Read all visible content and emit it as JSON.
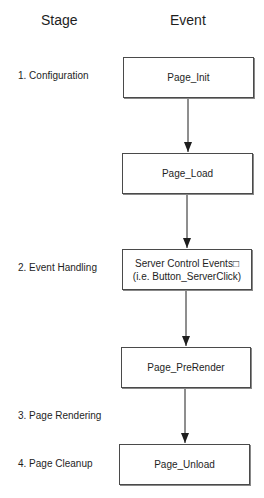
{
  "headers": {
    "stage": "Stage",
    "event": "Event"
  },
  "stages": [
    {
      "label": "1. Configuration"
    },
    {
      "label": "2. Event Handling"
    },
    {
      "label": "3. Page Rendering"
    },
    {
      "label": "4. Page Cleanup"
    }
  ],
  "events": [
    {
      "lines": [
        "Page_Init"
      ]
    },
    {
      "lines": [
        "Page_Load"
      ]
    },
    {
      "lines": [
        "Server Control Events□",
        "(i.e. Button_ServerClick)"
      ]
    },
    {
      "lines": [
        "Page_PreRender"
      ]
    },
    {
      "lines": [
        "Page_Unload"
      ]
    }
  ],
  "colors": {
    "line": "#1e1e1e",
    "box_border": "#4a4a4a"
  }
}
